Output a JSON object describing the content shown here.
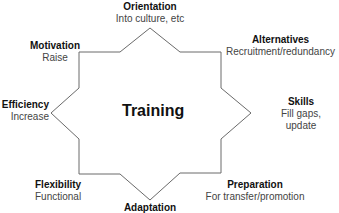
{
  "diagram": {
    "center_label": "Training",
    "line_color": "#666666",
    "nodes": [
      {
        "id": "orientation",
        "title": "Orientation",
        "subtitle": "Into culture, etc"
      },
      {
        "id": "alternatives",
        "title": "Alternatives",
        "subtitle": "Recruitment/redundancy"
      },
      {
        "id": "skills",
        "title": "Skills",
        "subtitle": "Fill gaps,",
        "subtitle2": "update"
      },
      {
        "id": "preparation",
        "title": "Preparation",
        "subtitle": "For transfer/promotion"
      },
      {
        "id": "adaptation",
        "title": "Adaptation",
        "subtitle": ""
      },
      {
        "id": "flexibility",
        "title": "Flexibility",
        "subtitle": "Functional"
      },
      {
        "id": "efficiency",
        "title": "Efficiency",
        "subtitle": "Increase"
      },
      {
        "id": "motivation",
        "title": "Motivation",
        "subtitle": "Raise"
      }
    ]
  }
}
